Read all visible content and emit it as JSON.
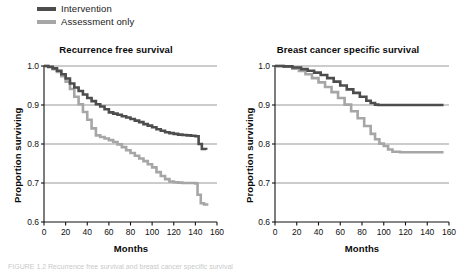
{
  "figure": {
    "background": "#ffffff",
    "caption": "FIGURE 1.2   Recurrence free survival and breast cancer specific survival"
  },
  "legend": {
    "position": "top-left",
    "items": [
      {
        "label": "Intervention",
        "color": "#4d4d4d",
        "swatch_name": "legend-swatch-intervention"
      },
      {
        "label": "Assessment only",
        "color": "#a6a6a6",
        "swatch_name": "legend-swatch-assessment"
      }
    ]
  },
  "colors": {
    "intervention": "#4d4d4d",
    "assessment": "#a6a6a6",
    "axis": "#111111",
    "gridline": "#6e6e6e"
  },
  "chart_data": [
    {
      "id": "recurrence-free-survival",
      "type": "line",
      "title": "Recurrence free survival",
      "xlabel": "Months",
      "ylabel": "Proportion surviving",
      "xlim": [
        0,
        160
      ],
      "ylim": [
        0.6,
        1.0
      ],
      "xticks": [
        0,
        20,
        40,
        60,
        80,
        100,
        120,
        140,
        160
      ],
      "yticks": [
        0.6,
        0.7,
        0.8,
        0.9,
        1.0
      ],
      "xtick_labels": [
        "0",
        "20",
        "40",
        "60",
        "80",
        "100",
        "120",
        "140",
        "160"
      ],
      "ytick_labels": [
        "0.6",
        "0.7",
        "0.8",
        "0.9",
        "1.0"
      ],
      "grid": "horizontal",
      "legend_position": "above-left-panel",
      "series": [
        {
          "name": "Intervention",
          "color": "#4d4d4d",
          "step": "post",
          "x": [
            0,
            4,
            8,
            12,
            16,
            20,
            24,
            28,
            32,
            36,
            40,
            44,
            48,
            52,
            56,
            60,
            64,
            68,
            72,
            76,
            80,
            84,
            88,
            92,
            96,
            100,
            104,
            108,
            112,
            116,
            120,
            124,
            128,
            132,
            136,
            140,
            143,
            146,
            150
          ],
          "y": [
            1.0,
            0.998,
            0.994,
            0.988,
            0.979,
            0.968,
            0.955,
            0.945,
            0.936,
            0.927,
            0.918,
            0.91,
            0.902,
            0.896,
            0.889,
            0.881,
            0.878,
            0.875,
            0.871,
            0.868,
            0.864,
            0.86,
            0.856,
            0.851,
            0.847,
            0.843,
            0.838,
            0.834,
            0.83,
            0.828,
            0.826,
            0.824,
            0.823,
            0.822,
            0.821,
            0.82,
            0.8,
            0.787,
            0.785
          ]
        },
        {
          "name": "Assessment only",
          "color": "#a6a6a6",
          "step": "post",
          "x": [
            0,
            4,
            8,
            12,
            16,
            20,
            24,
            28,
            32,
            36,
            40,
            44,
            48,
            52,
            56,
            60,
            64,
            68,
            72,
            76,
            80,
            84,
            88,
            92,
            96,
            100,
            104,
            108,
            112,
            116,
            120,
            124,
            128,
            132,
            136,
            140,
            142,
            145,
            148,
            152
          ],
          "y": [
            1.0,
            0.997,
            0.992,
            0.985,
            0.974,
            0.96,
            0.941,
            0.921,
            0.902,
            0.882,
            0.862,
            0.84,
            0.822,
            0.818,
            0.814,
            0.81,
            0.805,
            0.799,
            0.792,
            0.784,
            0.777,
            0.77,
            0.763,
            0.756,
            0.748,
            0.74,
            0.728,
            0.718,
            0.71,
            0.704,
            0.702,
            0.701,
            0.7,
            0.7,
            0.7,
            0.699,
            0.67,
            0.648,
            0.645,
            0.645
          ]
        }
      ]
    },
    {
      "id": "breast-cancer-specific-survival",
      "type": "line",
      "title": "Breast cancer specific survival",
      "xlabel": "Months",
      "ylabel": "Proportion surviving",
      "xlim": [
        0,
        160
      ],
      "ylim": [
        0.6,
        1.0
      ],
      "xticks": [
        0,
        20,
        40,
        60,
        80,
        100,
        120,
        140,
        160
      ],
      "yticks": [
        0.6,
        0.7,
        0.8,
        0.9,
        1.0
      ],
      "xtick_labels": [
        "0",
        "20",
        "40",
        "60",
        "80",
        "100",
        "120",
        "140",
        "160"
      ],
      "ytick_labels": [
        "0.6",
        "0.7",
        "0.8",
        "0.9",
        "1.0"
      ],
      "grid": "horizontal",
      "legend_position": "above-left-panel",
      "series": [
        {
          "name": "Intervention",
          "color": "#4d4d4d",
          "step": "post",
          "x": [
            0,
            8,
            16,
            24,
            30,
            36,
            42,
            48,
            54,
            60,
            66,
            72,
            78,
            84,
            88,
            92,
            95,
            100,
            110,
            120,
            130,
            140,
            150,
            155
          ],
          "y": [
            1.0,
            0.999,
            0.996,
            0.992,
            0.988,
            0.983,
            0.977,
            0.969,
            0.96,
            0.95,
            0.94,
            0.931,
            0.921,
            0.911,
            0.905,
            0.901,
            0.9,
            0.9,
            0.9,
            0.9,
            0.9,
            0.9,
            0.9,
            0.9
          ]
        },
        {
          "name": "Assessment only",
          "color": "#a6a6a6",
          "step": "post",
          "x": [
            0,
            8,
            16,
            22,
            28,
            34,
            40,
            46,
            52,
            58,
            64,
            70,
            76,
            82,
            88,
            92,
            96,
            100,
            104,
            108,
            115,
            125,
            135,
            145,
            155
          ],
          "y": [
            1.0,
            0.998,
            0.993,
            0.987,
            0.979,
            0.969,
            0.958,
            0.946,
            0.933,
            0.918,
            0.901,
            0.884,
            0.866,
            0.846,
            0.826,
            0.812,
            0.801,
            0.795,
            0.786,
            0.78,
            0.779,
            0.779,
            0.779,
            0.779,
            0.779
          ]
        }
      ]
    }
  ]
}
